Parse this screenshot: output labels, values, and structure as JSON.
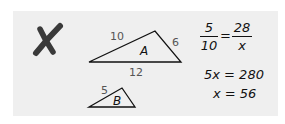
{
  "mark": {
    "icon": "cross-mark-icon",
    "color": "#3a3a3a"
  },
  "panel": {
    "background": "#efefef"
  },
  "triangle_a": {
    "name": "A",
    "sides": {
      "left": "10",
      "right": "6",
      "bottom": "12"
    }
  },
  "triangle_b": {
    "name": "B",
    "sides": {
      "left": "5"
    }
  },
  "work": {
    "proportion": {
      "left_num": "5",
      "left_den": "10",
      "equals": "=",
      "right_num": "28",
      "right_den": "x"
    },
    "step1": "5x = 280",
    "step2": "x = 56"
  }
}
